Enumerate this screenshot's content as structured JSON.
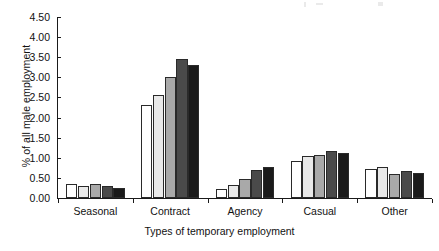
{
  "chart_data": {
    "type": "bar",
    "title": "",
    "xlabel": "Types of temporary employment",
    "ylabel": "% of all male employment",
    "categories": [
      "Seasonal",
      "Contract",
      "Agency",
      "Casual",
      "Other"
    ],
    "series": [
      {
        "name": "series-1",
        "color": "#ffffff",
        "values": [
          0.35,
          2.31,
          0.22,
          0.93,
          0.73
        ]
      },
      {
        "name": "series-2",
        "color": "#e9e9e9",
        "values": [
          0.3,
          2.56,
          0.32,
          1.05,
          0.78
        ]
      },
      {
        "name": "series-3",
        "color": "#a9a9a9",
        "values": [
          0.35,
          3.01,
          0.48,
          1.08,
          0.6
        ]
      },
      {
        "name": "series-4",
        "color": "#4a4a4a",
        "values": [
          0.3,
          3.45,
          0.69,
          1.16,
          0.68
        ]
      },
      {
        "name": "series-5",
        "color": "#1a1a1a",
        "values": [
          0.26,
          3.31,
          0.76,
          1.13,
          0.63
        ]
      }
    ],
    "ylim": [
      0,
      4.5
    ],
    "ytick_labels": [
      "0.00",
      "0.50",
      "1.00",
      "1.50",
      "2.00",
      "2.50",
      "3.00",
      "3.50",
      "4.00",
      "4.50"
    ],
    "ytick_values": [
      0,
      0.5,
      1,
      1.5,
      2,
      2.5,
      3,
      3.5,
      4,
      4.5
    ],
    "grid": false,
    "legend": "none"
  }
}
